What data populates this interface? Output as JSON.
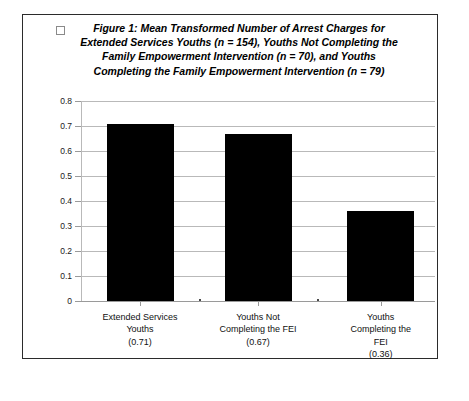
{
  "figure": {
    "marker_icon": "empty-square-marker",
    "title": "Figure 1: Mean Transformed Number of Arrest Charges for Extended Services Youths (n = 154), Youths Not Completing the Family Empowerment Intervention (n = 70), and Youths Completing the Family Empowerment Intervention (n = 79)"
  },
  "chart_data": {
    "type": "bar",
    "title": "Figure 1: Mean Transformed Number of Arrest Charges for Extended Services Youths (n = 154), Youths Not Completing the Family Empowerment Intervention (n = 70), and Youths Completing the Family Empowerment Intervention (n = 79)",
    "xlabel": "",
    "ylabel": "",
    "categories": [
      "Extended Services Youths",
      "Youths Not Completing the FEI",
      "Youths Completing the FEI"
    ],
    "category_label_lines": [
      [
        "Extended Services",
        "Youths",
        "(0.71)"
      ],
      [
        "Youths Not",
        "Completing the FEI",
        "(0.67)"
      ],
      [
        "Youths",
        "Completing the",
        "FEI",
        "(0.36)"
      ]
    ],
    "values": [
      0.71,
      0.67,
      0.36
    ],
    "value_labels": [
      "(0.71)",
      "(0.67)",
      "(0.36)"
    ],
    "group_sizes": [
      154,
      70,
      79
    ],
    "ylim": [
      0,
      0.8
    ],
    "ytick_labels": [
      "0.8",
      "0.7",
      "0.6",
      "0.5",
      "0.4",
      "0.3",
      "0.2",
      "0.1",
      "0"
    ],
    "ytick_values": [
      0.8,
      0.7,
      0.6,
      0.5,
      0.4,
      0.3,
      0.2,
      0.1,
      0
    ],
    "grid": true,
    "legend": "none",
    "bar_color": "#000000",
    "gridline_color": "#b9b9b9"
  }
}
